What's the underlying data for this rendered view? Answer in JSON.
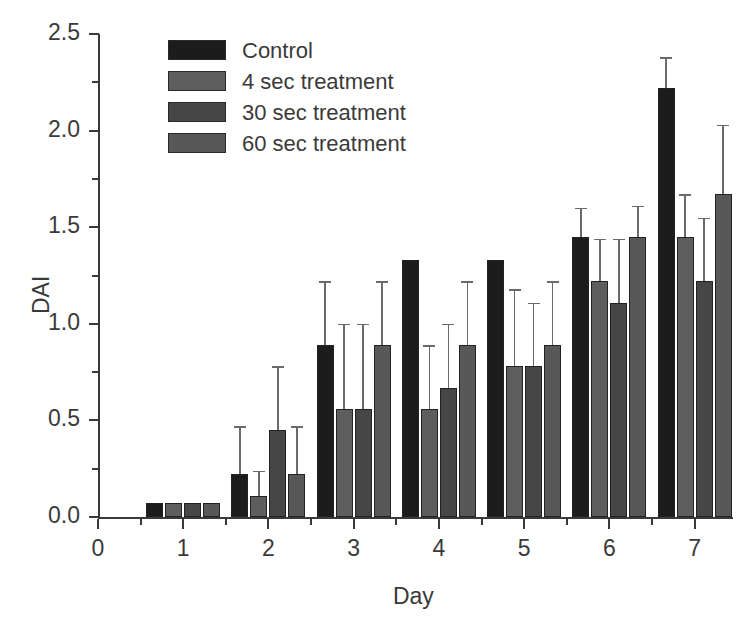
{
  "chart_data": {
    "type": "bar",
    "title": "",
    "xlabel": "Day",
    "ylabel": "DAI",
    "categories": [
      "1",
      "2",
      "3",
      "4",
      "5",
      "6",
      "7"
    ],
    "x": [
      1,
      2,
      3,
      4,
      5,
      6,
      7
    ],
    "xlim": [
      0,
      7.45
    ],
    "ylim": [
      0.0,
      2.5
    ],
    "xticks": [
      "0",
      "1",
      "2",
      "3",
      "4",
      "5",
      "6",
      "7"
    ],
    "yticks": [
      "0.0",
      "0.5",
      "1.0",
      "1.5",
      "2.0",
      "2.5"
    ],
    "yminorticks": [
      0.25,
      0.75,
      1.25,
      1.75,
      2.25
    ],
    "grid": false,
    "legend_position": "upper-left-inside",
    "series": [
      {
        "name": "Control",
        "color": "#1c1c1c",
        "values": [
          0.0,
          0.22,
          0.89,
          1.33,
          1.33,
          1.45,
          2.22
        ],
        "errors": [
          0.0,
          0.25,
          0.33,
          0.0,
          0.0,
          0.15,
          0.16
        ]
      },
      {
        "name": "4 sec treatment",
        "color": "#5e5e5e",
        "values": [
          0.0,
          0.11,
          0.56,
          0.56,
          0.78,
          1.22,
          1.45
        ],
        "errors": [
          0.0,
          0.13,
          0.44,
          0.33,
          0.4,
          0.22,
          0.22
        ]
      },
      {
        "name": "30 sec treatment",
        "color": "#464646",
        "values": [
          0.0,
          0.45,
          0.56,
          0.67,
          0.78,
          1.11,
          1.22
        ],
        "errors": [
          0.0,
          0.33,
          0.44,
          0.33,
          0.33,
          0.33,
          0.33
        ]
      },
      {
        "name": "60 sec treatment",
        "color": "#585858",
        "values": [
          0.0,
          0.22,
          0.89,
          0.89,
          0.89,
          1.45,
          1.67
        ],
        "errors": [
          0.0,
          0.25,
          0.33,
          0.33,
          0.33,
          0.16,
          0.36
        ]
      }
    ]
  },
  "legend": {
    "items": [
      {
        "label": "Control"
      },
      {
        "label": "4 sec treatment"
      },
      {
        "label": "30 sec treatment"
      },
      {
        "label": "60 sec treatment"
      }
    ]
  }
}
